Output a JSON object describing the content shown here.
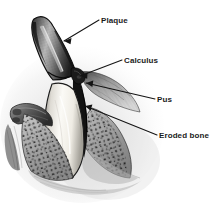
{
  "figure": {
    "background_color": "#ffffff",
    "ink_color": "#141414",
    "labels": [
      {
        "id": "plaque",
        "text": "Plaque",
        "text_x": 101,
        "text_y": 23,
        "leader": "M 99 20 L 64 41",
        "arrow_points": "64,41 71,38 70,44",
        "points_to": "dark stippled deposit on tooth crown surface"
      },
      {
        "id": "calculus",
        "text": "Calculus",
        "text_x": 124,
        "text_y": 63,
        "leader": "M 122 60 L 80 76",
        "arrow_points": "80,76 87,72 87,78",
        "points_to": "hardened mineral deposit at gumline"
      },
      {
        "id": "pus",
        "text": "Pus",
        "text_x": 157,
        "text_y": 102,
        "leader": "M 155 99 L 86 83",
        "arrow_points": "86,83 93,81 92,87",
        "points_to": "exudate in periodontal pocket"
      },
      {
        "id": "eroded-bone",
        "text": "Eroded bone",
        "text_x": 159,
        "text_y": 138,
        "leader": "M 157 135 L 85 106",
        "arrow_points": "85,106 92,105 90,111",
        "points_to": "resorbed alveolar bone crest"
      }
    ],
    "anatomy": [
      {
        "id": "tooth-crown-plaque",
        "label": "Plaque-covered crown",
        "tone": "#4a4a4a"
      },
      {
        "id": "tooth-root-enamel",
        "label": "Tooth root",
        "tone": "#f2efe9"
      },
      {
        "id": "calculus-deposit",
        "label": "Calculus deposit",
        "tone": "#2a2a2a"
      },
      {
        "id": "gingiva-left",
        "label": "Left gingival margin",
        "tone": "#6e6e6e"
      },
      {
        "id": "gingiva-right",
        "label": "Right gingival flap",
        "tone": "#8a8a8a"
      },
      {
        "id": "alveolar-bone-left",
        "label": "Left trabecular bone",
        "tone": "#9a9a9a"
      },
      {
        "id": "alveolar-bone-right",
        "label": "Right trabecular bone",
        "tone": "#9a9a9a"
      },
      {
        "id": "periodontal-pocket",
        "label": "Periodontal pocket",
        "tone": "#1a1a1a"
      }
    ]
  }
}
